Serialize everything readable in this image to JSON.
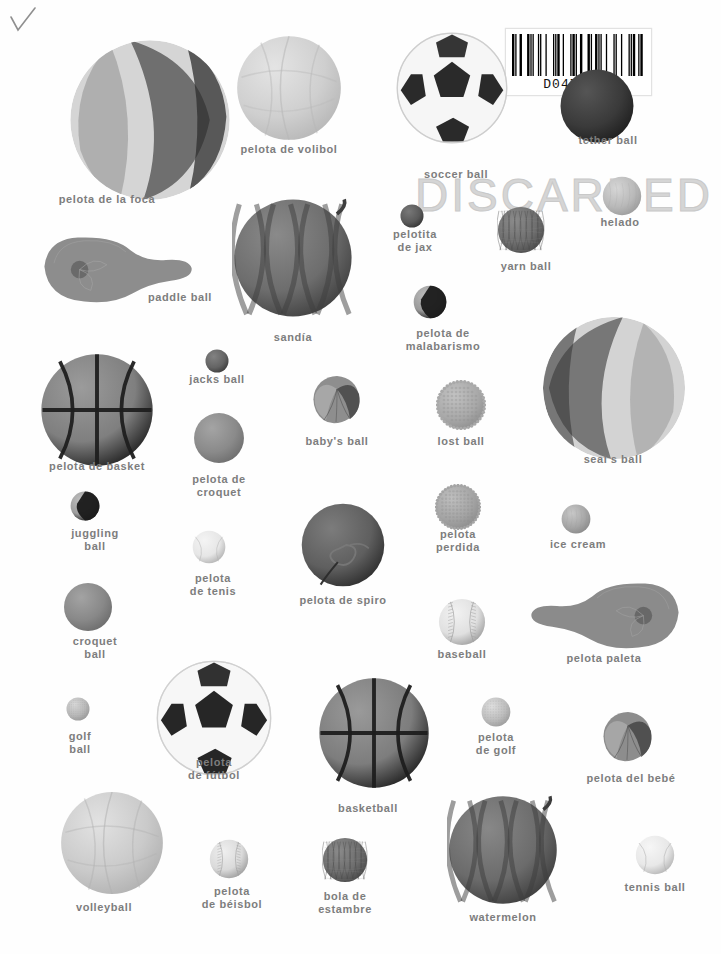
{
  "page": {
    "background_color": "#fefefe",
    "label_color": "#7d7d7d",
    "width": 721,
    "height": 954
  },
  "marks": {
    "checkmark": "✓",
    "stamp_text": "DISCARDED",
    "faint_top_text": "",
    "barcode": {
      "number": "D0471024",
      "pattern": "1101001110110100111010011101001101110100110100111011011101001"
    }
  },
  "items": [
    {
      "id": "pelota-de-la-foca",
      "label": "pelota de la foca",
      "kind": "beach-ball",
      "x": 150,
      "y": 120,
      "r": 83,
      "label_x": 107,
      "label_y": 193,
      "colors": {
        "a": "#d5d5d5",
        "b": "#6f6f6f",
        "c": "#8f8f8f"
      }
    },
    {
      "id": "pelota-de-volibol",
      "label": "pelota de volibol",
      "kind": "volleyball",
      "x": 289,
      "y": 88,
      "r": 54,
      "label_x": 289,
      "label_y": 143,
      "colors": {
        "a": "#cfcfcf",
        "b": "#b6b6b6",
        "c": "#e4e4e4"
      }
    },
    {
      "id": "soccer-ball",
      "label": "soccer ball",
      "kind": "soccer",
      "x": 452,
      "y": 88,
      "r": 57,
      "label_x": 456,
      "label_y": 168,
      "colors": {
        "a": "#f6f6f6",
        "b": "#2a2a2a",
        "c": "#cdcdcd"
      }
    },
    {
      "id": "tether-ball",
      "label": "tether ball",
      "kind": "dark-sphere",
      "x": 597,
      "y": 106,
      "r": 38,
      "label_x": 608,
      "label_y": 134,
      "colors": {
        "a": "#3a3a3a",
        "b": "#1d1d1d",
        "c": "#555555"
      }
    },
    {
      "id": "helado",
      "label": "helado",
      "kind": "scoop",
      "x": 622,
      "y": 196,
      "r": 20,
      "label_x": 620,
      "label_y": 216,
      "colors": {
        "a": "#b9b9b9",
        "b": "#9a9a9a",
        "c": "#d6d6d6"
      }
    },
    {
      "id": "pelotita-de-jax",
      "label": "pelotita\nde jax",
      "kind": "dark-sphere",
      "x": 412,
      "y": 216,
      "r": 12,
      "label_x": 415,
      "label_y": 228,
      "colors": {
        "a": "#5a5a5a",
        "b": "#333333",
        "c": "#787878"
      }
    },
    {
      "id": "yarn-ball",
      "label": "yarn ball",
      "kind": "yarn",
      "x": 521,
      "y": 230,
      "r": 24,
      "label_x": 526,
      "label_y": 260,
      "colors": {
        "a": "#6e6e6e",
        "b": "#4b4b4b",
        "c": "#8b8b8b"
      }
    },
    {
      "id": "paddle-ball",
      "label": "paddle ball",
      "kind": "paddle",
      "x": 118,
      "y": 268,
      "r": 80,
      "label_x": 180,
      "label_y": 291,
      "colors": {
        "a": "#8d8d8d",
        "b": "#6a6a6a",
        "c": "#a5a5a5"
      }
    },
    {
      "id": "sandia",
      "label": "sandía",
      "kind": "watermelon",
      "x": 293,
      "y": 258,
      "r": 61,
      "label_x": 293,
      "label_y": 331,
      "colors": {
        "a": "#6d6d6d",
        "b": "#3e3e3e",
        "c": "#8a8a8a"
      }
    },
    {
      "id": "pelota-de-malabarismo",
      "label": "pelota de\nmalabarismo",
      "kind": "juggling-two-tone",
      "x": 430,
      "y": 302,
      "r": 17,
      "label_x": 443,
      "label_y": 327,
      "colors": {
        "a": "#9a9a9a",
        "b": "#1c1c1c",
        "c": "#bcbcbc"
      }
    },
    {
      "id": "seals-ball",
      "label": "seal's ball",
      "kind": "beach-ball-2",
      "x": 614,
      "y": 388,
      "r": 74,
      "label_x": 613,
      "label_y": 453,
      "colors": {
        "a": "#d3d3d3",
        "b": "#777777",
        "c": "#949494"
      }
    },
    {
      "id": "pelota-de-basket",
      "label": "pelota de basket",
      "kind": "basketball",
      "x": 97,
      "y": 410,
      "r": 58,
      "label_x": 97,
      "label_y": 460,
      "colors": {
        "a": "#7f7f7f",
        "b": "#1f1f1f",
        "c": "#9b9b9b"
      }
    },
    {
      "id": "jacks-ball",
      "label": "jacks ball",
      "kind": "dark-sphere",
      "x": 217,
      "y": 361,
      "r": 12,
      "label_x": 217,
      "label_y": 373,
      "colors": {
        "a": "#646464",
        "b": "#3a3a3a",
        "c": "#828282"
      }
    },
    {
      "id": "babys-ball",
      "label": "baby's ball",
      "kind": "beanbag",
      "x": 337,
      "y": 399,
      "r": 25,
      "label_x": 337,
      "label_y": 435,
      "colors": {
        "a": "#8e8e8e",
        "b": "#4e4e4e",
        "c": "#ababab"
      }
    },
    {
      "id": "lost-ball",
      "label": "lost ball",
      "kind": "nubby",
      "x": 461,
      "y": 405,
      "r": 25,
      "label_x": 461,
      "label_y": 435,
      "colors": {
        "a": "#a9a9a9",
        "b": "#8c8c8c",
        "c": "#c2c2c2"
      }
    },
    {
      "id": "pelota-de-croquet",
      "label": "pelota de\ncroquet",
      "kind": "solid-sphere",
      "x": 219,
      "y": 438,
      "r": 26,
      "label_x": 219,
      "label_y": 473,
      "colors": {
        "a": "#8a8a8a",
        "b": "#6c6c6c",
        "c": "#a4a4a4"
      }
    },
    {
      "id": "juggling-ball",
      "label": "juggling\nball",
      "kind": "juggling-two-tone",
      "x": 85,
      "y": 506,
      "r": 15,
      "label_x": 95,
      "label_y": 527,
      "colors": {
        "a": "#9d9d9d",
        "b": "#1b1b1b",
        "c": "#c0c0c0"
      }
    },
    {
      "id": "pelota-perdida",
      "label": "pelota\nperdida",
      "kind": "nubby",
      "x": 458,
      "y": 507,
      "r": 23,
      "label_x": 458,
      "label_y": 528,
      "colors": {
        "a": "#a4a4a4",
        "b": "#8a8a8a",
        "c": "#bfbfbf"
      }
    },
    {
      "id": "ice-cream",
      "label": "ice cream",
      "kind": "scoop",
      "x": 576,
      "y": 519,
      "r": 15,
      "label_x": 578,
      "label_y": 538,
      "colors": {
        "a": "#a6a6a6",
        "b": "#898989",
        "c": "#c8c8c8"
      }
    },
    {
      "id": "pelota-de-tenis",
      "label": "pelota\nde tenis",
      "kind": "tennis",
      "x": 209,
      "y": 547,
      "r": 17,
      "label_x": 213,
      "label_y": 572,
      "colors": {
        "a": "#e6e6e6",
        "b": "#b0b0b0",
        "c": "#f4f4f4"
      }
    },
    {
      "id": "pelota-de-spiro",
      "label": "pelota de spiro",
      "kind": "tether-dark",
      "x": 343,
      "y": 545,
      "r": 43,
      "label_x": 343,
      "label_y": 594,
      "colors": {
        "a": "#5f5f5f",
        "b": "#2b2b2b",
        "c": "#7c7c7c"
      }
    },
    {
      "id": "croquet-ball",
      "label": "croquet\nball",
      "kind": "solid-sphere",
      "x": 88,
      "y": 607,
      "r": 25,
      "label_x": 95,
      "label_y": 635,
      "colors": {
        "a": "#888888",
        "b": "#6b6b6b",
        "c": "#a3a3a3"
      }
    },
    {
      "id": "baseball",
      "label": "baseball",
      "kind": "baseball",
      "x": 462,
      "y": 622,
      "r": 24,
      "label_x": 462,
      "label_y": 648,
      "colors": {
        "a": "#e0e0e0",
        "b": "#9c9c9c",
        "c": "#f2f2f2"
      }
    },
    {
      "id": "pelota-paleta",
      "label": "pelota paleta",
      "kind": "paddle-r",
      "x": 605,
      "y": 614,
      "r": 80,
      "label_x": 604,
      "label_y": 652,
      "colors": {
        "a": "#8b8b8b",
        "b": "#686868",
        "c": "#a2a2a2"
      }
    },
    {
      "id": "golf-ball",
      "label": "golf\nball",
      "kind": "golf",
      "x": 78,
      "y": 709,
      "r": 12,
      "label_x": 80,
      "label_y": 730,
      "colors": {
        "a": "#b8b8b8",
        "b": "#979797",
        "c": "#d8d8d8"
      }
    },
    {
      "id": "pelota-de-futbol",
      "label": "pelota\nde fútbol",
      "kind": "soccer",
      "x": 214,
      "y": 718,
      "r": 59,
      "label_x": 214,
      "label_y": 756,
      "colors": {
        "a": "#f7f7f7",
        "b": "#262626",
        "c": "#d0d0d0"
      }
    },
    {
      "id": "basketball",
      "label": "basketball",
      "kind": "basketball",
      "x": 374,
      "y": 733,
      "r": 57,
      "label_x": 368,
      "label_y": 802,
      "colors": {
        "a": "#7d7d7d",
        "b": "#1e1e1e",
        "c": "#9a9a9a"
      }
    },
    {
      "id": "pelota-de-golf",
      "label": "pelota\nde golf",
      "kind": "golf",
      "x": 496,
      "y": 712,
      "r": 15,
      "label_x": 496,
      "label_y": 731,
      "colors": {
        "a": "#bdbdbd",
        "b": "#9a9a9a",
        "c": "#dedede"
      }
    },
    {
      "id": "pelota-del-bebe",
      "label": "pelota del bebé",
      "kind": "beanbag",
      "x": 628,
      "y": 736,
      "r": 26,
      "label_x": 631,
      "label_y": 772,
      "colors": {
        "a": "#8d8d8d",
        "b": "#4d4d4d",
        "c": "#aaaaaa"
      }
    },
    {
      "id": "volleyball",
      "label": "volleyball",
      "kind": "volleyball",
      "x": 112,
      "y": 843,
      "r": 53,
      "label_x": 104,
      "label_y": 901,
      "colors": {
        "a": "#cacaca",
        "b": "#b0b0b0",
        "c": "#e2e2e2"
      }
    },
    {
      "id": "pelota-de-beisbol",
      "label": "pelota\nde béisbol",
      "kind": "baseball",
      "x": 229,
      "y": 859,
      "r": 20,
      "label_x": 232,
      "label_y": 885,
      "colors": {
        "a": "#dadada",
        "b": "#9a9a9a",
        "c": "#efefef"
      }
    },
    {
      "id": "bola-de-estambre",
      "label": "bola de\nestambre",
      "kind": "yarn",
      "x": 345,
      "y": 860,
      "r": 23,
      "label_x": 345,
      "label_y": 890,
      "colors": {
        "a": "#6d6d6d",
        "b": "#474747",
        "c": "#8a8a8a"
      }
    },
    {
      "id": "watermelon",
      "label": "watermelon",
      "kind": "watermelon",
      "x": 503,
      "y": 850,
      "r": 56,
      "label_x": 503,
      "label_y": 911,
      "colors": {
        "a": "#6b6b6b",
        "b": "#3c3c3c",
        "c": "#888888"
      }
    },
    {
      "id": "tennis-ball",
      "label": "tennis ball",
      "kind": "tennis",
      "x": 655,
      "y": 855,
      "r": 20,
      "label_x": 655,
      "label_y": 881,
      "colors": {
        "a": "#e8e8e8",
        "b": "#b2b2b2",
        "c": "#f6f6f6"
      }
    }
  ]
}
